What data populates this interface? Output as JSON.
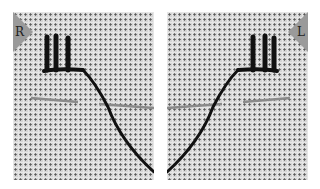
{
  "panels": [
    {
      "id": "right",
      "label": "R"
    },
    {
      "id": "left",
      "label": "L"
    }
  ],
  "colors": {
    "canvas": "#d4d4d4",
    "thread": "#111111",
    "needle": "#8a8a8a",
    "tag": "#9a9a9a"
  }
}
